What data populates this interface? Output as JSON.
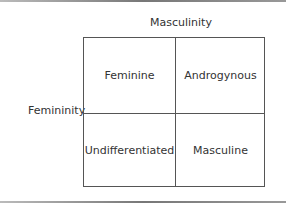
{
  "diagram": {
    "x_axis_label": "Masculinity",
    "y_axis_label": "Femininity",
    "cells": [
      {
        "label": "Feminine",
        "position": "top-left"
      },
      {
        "label": "Androgynous",
        "position": "top-right"
      },
      {
        "label": "Undifferentiated",
        "position": "bottom-left"
      },
      {
        "label": "Masculine",
        "position": "bottom-right"
      }
    ]
  }
}
